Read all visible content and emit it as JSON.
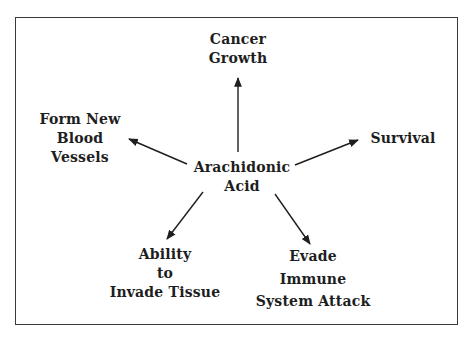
{
  "diagram": {
    "type": "hub-and-spoke",
    "center": {
      "lines": [
        "Arachidonic",
        "Acid"
      ]
    },
    "effects": [
      {
        "id": "top",
        "lines": [
          "Cancer",
          "Growth"
        ],
        "direction": "up"
      },
      {
        "id": "left",
        "lines": [
          "Form New",
          "Blood",
          "Vessels"
        ],
        "direction": "upper-left"
      },
      {
        "id": "right",
        "lines": [
          "Survival"
        ],
        "direction": "upper-right"
      },
      {
        "id": "bottom-left",
        "lines": [
          "Ability",
          "to",
          "Invade Tissue"
        ],
        "direction": "lower-left"
      },
      {
        "id": "bottom-right",
        "lines": [
          "Evade",
          "Immune",
          "System Attack"
        ],
        "direction": "lower-right"
      }
    ],
    "colors": {
      "border": "#3a3a3a",
      "text": "#1e1e1e",
      "arrow": "#1e1e1e",
      "background": "#ffffff"
    }
  }
}
